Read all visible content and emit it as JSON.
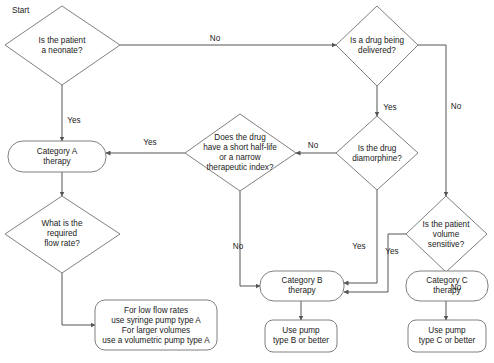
{
  "diagram": {
    "title_label": "Start",
    "colors": {
      "shape_stroke": "#808080",
      "connector_stroke": "#555555",
      "text": "#1a1a1a",
      "background": "#ffffff"
    },
    "nodes": {
      "neonate": {
        "text_lines": [
          "Is the patient",
          "a neonate?"
        ],
        "shape": "decision"
      },
      "drug_delivered": {
        "text_lines": [
          "Is a drug being",
          "delivered?"
        ],
        "shape": "decision"
      },
      "half_life": {
        "text_lines": [
          "Does the drug",
          "have a short half-life",
          "or a narrow",
          "therapeutic index?"
        ],
        "shape": "decision"
      },
      "diamorphine": {
        "text_lines": [
          "Is the drug",
          "diamorphine?"
        ],
        "shape": "decision"
      },
      "volume_sensitive": {
        "text_lines": [
          "Is the patient",
          "volume",
          "sensitive?"
        ],
        "shape": "decision"
      },
      "category_a": {
        "text_lines": [
          "Category A",
          "therapy"
        ],
        "shape": "terminator"
      },
      "category_b": {
        "text_lines": [
          "Category B",
          "therapy"
        ],
        "shape": "terminator"
      },
      "category_c": {
        "text_lines": [
          "Category C",
          "therapy"
        ],
        "shape": "terminator"
      },
      "flow_rate": {
        "text_lines": [
          "What is the",
          "required",
          "flow rate?"
        ],
        "shape": "decision"
      },
      "pump_a_advice": {
        "text_lines": [
          "For low flow rates",
          "use syringe pump type A",
          "For larger volumes",
          "use a volumetric pump type A"
        ],
        "shape": "terminator"
      },
      "pump_b": {
        "text_lines": [
          "Use pump",
          "type B or better"
        ],
        "shape": "terminator"
      },
      "pump_c": {
        "text_lines": [
          "Use pump",
          "type C or better"
        ],
        "shape": "terminator"
      }
    },
    "edge_labels": {
      "neonate_no": "No",
      "neonate_yes": "Yes",
      "drug_delivered_yes": "Yes",
      "drug_delivered_no": "No",
      "diamorphine_no": "No",
      "diamorphine_yes": "Yes",
      "half_life_yes": "Yes",
      "half_life_no": "No",
      "volume_yes": "Yes",
      "volume_no": "No"
    }
  }
}
